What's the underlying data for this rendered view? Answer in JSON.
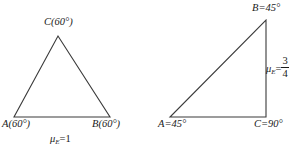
{
  "figure": {
    "background_color": "#ffffff",
    "stroke_color": "#3a3a3a",
    "text_color": "#1a1a1a"
  },
  "left_triangle": {
    "name": "equilateral-triangle",
    "vertices": {
      "A": {
        "x": 14,
        "y": 117
      },
      "B": {
        "x": 110,
        "y": 117
      },
      "C": {
        "x": 58,
        "y": 36
      }
    },
    "labels": {
      "C": {
        "vertex": "C",
        "text": "C(60°)"
      },
      "A": {
        "vertex": "A",
        "text": "A(60°)"
      },
      "B": {
        "vertex": "B",
        "text": "B(60°)"
      }
    },
    "mu": {
      "symbol": "μ",
      "subscript": "E",
      "equals": "=",
      "value": "1"
    }
  },
  "right_triangle": {
    "name": "right-isosceles-triangle",
    "vertices": {
      "A": {
        "x": 170,
        "y": 117
      },
      "B": {
        "x": 266,
        "y": 20
      },
      "C": {
        "x": 266,
        "y": 117
      }
    },
    "labels": {
      "B": {
        "vertex": "B",
        "text": "B=45°"
      },
      "A": {
        "vertex": "A",
        "text": "A=45°"
      },
      "C": {
        "vertex": "C",
        "text": "C=90°"
      }
    },
    "mu": {
      "symbol": "μ",
      "subscript": "E",
      "equals": "=",
      "numerator": "3",
      "denominator": "4"
    }
  }
}
